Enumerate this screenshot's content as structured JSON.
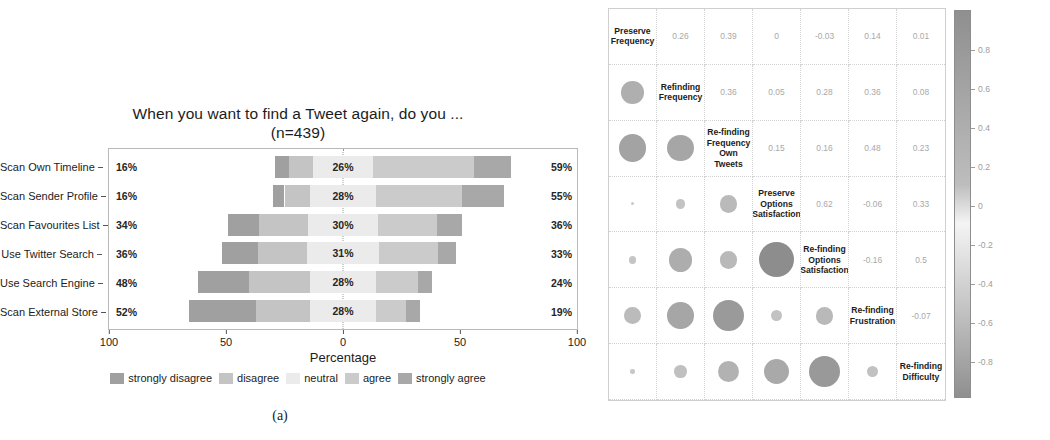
{
  "figure": {
    "caption_a": "(a)",
    "caption_b": "(b)"
  },
  "chart_data": [
    {
      "type": "bar",
      "subtype": "diverging-stacked-likert",
      "title": "When you want to find a Tweet again, do you ...",
      "subtitle": "(n=439)",
      "xlabel": "Percentage",
      "ylabel": "",
      "xlim": [
        -100,
        100
      ],
      "xticks": [
        "100",
        "50",
        "0",
        "50",
        "100"
      ],
      "xtick_values": [
        -100,
        -50,
        0,
        50,
        100
      ],
      "grid": false,
      "legend_position": "bottom",
      "categories": [
        "Scan Own Timeline",
        "Scan Sender Profile",
        "Scan Favourites List",
        "Use Twitter Search",
        "Use Search Engine",
        "Scan External Store"
      ],
      "series": [
        {
          "name": "strongly disagree",
          "color": "#a0a0a0",
          "values": [
            6,
            5,
            13,
            15,
            22,
            29
          ]
        },
        {
          "name": "disagree",
          "color": "#c4c4c4",
          "values": [
            10,
            11,
            21,
            21,
            26,
            23
          ]
        },
        {
          "name": "neutral",
          "color": "#ebebeb",
          "values": [
            26,
            28,
            30,
            31,
            28,
            28
          ]
        },
        {
          "name": "agree",
          "color": "#cbcbcb",
          "values": [
            43,
            37,
            25,
            25,
            18,
            13
          ]
        },
        {
          "name": "strongly agree",
          "color": "#a8a8a8",
          "values": [
            16,
            18,
            11,
            8,
            6,
            6
          ]
        }
      ],
      "left_totals": [
        "16%",
        "16%",
        "34%",
        "36%",
        "48%",
        "52%"
      ],
      "right_totals": [
        "59%",
        "55%",
        "36%",
        "33%",
        "24%",
        "19%"
      ],
      "center_labels": [
        "26%",
        "28%",
        "30%",
        "31%",
        "28%",
        "28%"
      ],
      "legend": [
        "strongly disagree",
        "disagree",
        "neutral",
        "agree",
        "strongly agree"
      ]
    },
    {
      "type": "heatmap",
      "subtype": "correlation-matrix",
      "title": "",
      "variables": [
        "Preserve Frequency",
        "Refinding Frequency",
        "Re-finding Frequency Own Tweets",
        "Preserve Options Satisfaction",
        "Re-finding Options Satisfaction",
        "Re-finding Frustration",
        "Re-finding Difficulty"
      ],
      "matrix": [
        [
          null,
          0.26,
          0.39,
          0,
          -0.03,
          0.14,
          0.01
        ],
        [
          0.26,
          null,
          0.36,
          0.05,
          0.28,
          0.36,
          0.08
        ],
        [
          0.39,
          0.36,
          null,
          0.15,
          0.16,
          0.48,
          0.23
        ],
        [
          0,
          0.05,
          0.15,
          null,
          0.62,
          -0.06,
          0.33
        ],
        [
          -0.03,
          0.28,
          0.16,
          0.62,
          null,
          -0.16,
          0.5
        ],
        [
          0.14,
          0.36,
          0.48,
          -0.06,
          -0.16,
          null,
          -0.07
        ],
        [
          0.01,
          0.08,
          0.23,
          0.33,
          0.5,
          -0.07,
          null
        ]
      ],
      "upper_labels": [
        [
          "0.26",
          "0.39",
          "0",
          "-0.03",
          "0.14",
          "0.01"
        ],
        [
          "0.36",
          "0.05",
          "0.28",
          "0.36",
          "0.08"
        ],
        [
          "0.15",
          "0.16",
          "0.48",
          "0.23"
        ],
        [
          "0.62",
          "-0.06",
          "0.33"
        ],
        [
          "-0.16",
          "0.5"
        ],
        [
          "-0.07"
        ]
      ],
      "colorbar": {
        "ticks": [
          "0.8",
          "0.6",
          "0.4",
          "0.2",
          "0",
          "-0.2",
          "-0.4",
          "-0.6",
          "-0.8"
        ],
        "range": [
          -1,
          1
        ],
        "orientation": "vertical"
      }
    }
  ]
}
